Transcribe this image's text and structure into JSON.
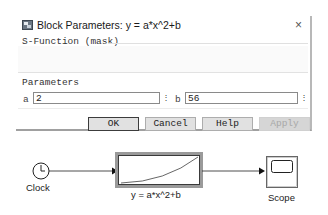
{
  "dialog": {
    "title": "Block Parameters: y = a*x^2+b",
    "close_glyph": "×",
    "section_title": "S-Function (mask)",
    "parameters_title": "Parameters",
    "fields": [
      {
        "label": "a",
        "value": "2",
        "spin_glyph": "⋮"
      },
      {
        "label": "b",
        "value": "56",
        "spin_glyph": "⋮"
      }
    ],
    "buttons": {
      "ok": "OK",
      "cancel": "Cancel",
      "help": "Help",
      "apply": "Apply"
    }
  },
  "diagram": {
    "blocks": [
      {
        "name": "Clock",
        "label": "Clock"
      },
      {
        "name": "S-Function",
        "label": "y = a*x^2+b"
      },
      {
        "name": "Scope",
        "label": "Scope"
      }
    ],
    "colors": {
      "line": "#222222",
      "block_border": "#3a3a3a",
      "selected_halo": "#9a9a9a"
    }
  }
}
